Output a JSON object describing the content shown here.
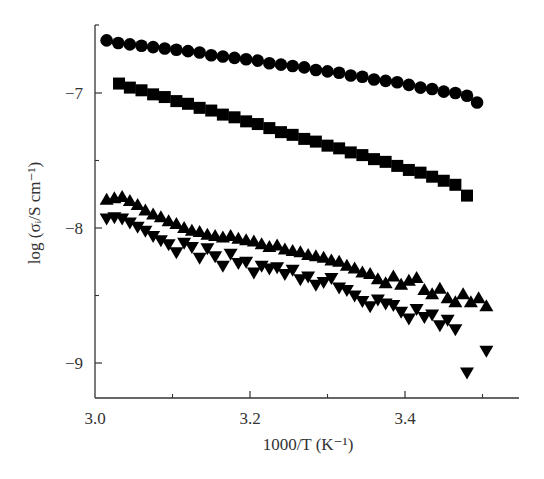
{
  "chart_data": {
    "type": "scatter",
    "title": "",
    "xlabel": "1000/T (K⁻¹)",
    "ylabel": "log (σᵢ/S cm⁻¹)",
    "xlim": [
      3.0,
      3.55
    ],
    "ylim": [
      -9.26,
      -6.34
    ],
    "x_ticks": [
      3.0,
      3.2,
      3.4
    ],
    "x_tick_labels": [
      "3.0",
      "3.2",
      "3.4"
    ],
    "x_minor_ticks": [
      3.1,
      3.3,
      3.5
    ],
    "y_ticks": [
      -7,
      -8,
      -9
    ],
    "y_tick_labels": [
      "−7",
      "−8",
      "−9"
    ],
    "y_minor_ticks": [
      -6.5,
      -7.5,
      -8.5
    ],
    "grid": false,
    "legend": "none",
    "series": [
      {
        "name": "circles",
        "marker": "circle",
        "x": [
          3.015,
          3.03,
          3.045,
          3.06,
          3.075,
          3.09,
          3.105,
          3.12,
          3.135,
          3.15,
          3.165,
          3.18,
          3.195,
          3.21,
          3.225,
          3.24,
          3.255,
          3.27,
          3.285,
          3.3,
          3.315,
          3.33,
          3.345,
          3.36,
          3.375,
          3.39,
          3.405,
          3.42,
          3.435,
          3.45,
          3.465,
          3.48,
          3.493
        ],
        "y": [
          -6.61,
          -6.63,
          -6.64,
          -6.65,
          -6.66,
          -6.67,
          -6.68,
          -6.69,
          -6.7,
          -6.72,
          -6.73,
          -6.74,
          -6.75,
          -6.76,
          -6.78,
          -6.79,
          -6.8,
          -6.81,
          -6.83,
          -6.84,
          -6.85,
          -6.87,
          -6.88,
          -6.9,
          -6.91,
          -6.92,
          -6.94,
          -6.96,
          -6.97,
          -6.99,
          -7.0,
          -7.02,
          -7.07
        ]
      },
      {
        "name": "squares",
        "marker": "square",
        "x": [
          3.031,
          3.045,
          3.06,
          3.075,
          3.09,
          3.105,
          3.12,
          3.135,
          3.15,
          3.165,
          3.18,
          3.195,
          3.21,
          3.225,
          3.24,
          3.255,
          3.27,
          3.285,
          3.3,
          3.315,
          3.33,
          3.345,
          3.36,
          3.375,
          3.39,
          3.405,
          3.42,
          3.435,
          3.45,
          3.465,
          3.48
        ],
        "y": [
          -6.93,
          -6.96,
          -6.98,
          -7.01,
          -7.03,
          -7.06,
          -7.08,
          -7.11,
          -7.13,
          -7.16,
          -7.18,
          -7.21,
          -7.23,
          -7.26,
          -7.29,
          -7.31,
          -7.34,
          -7.36,
          -7.39,
          -7.41,
          -7.44,
          -7.46,
          -7.49,
          -7.51,
          -7.54,
          -7.57,
          -7.59,
          -7.62,
          -7.65,
          -7.68,
          -7.76
        ]
      },
      {
        "name": "up-triangles",
        "marker": "triangle-up",
        "x": [
          3.015,
          3.025,
          3.035,
          3.045,
          3.055,
          3.065,
          3.075,
          3.085,
          3.095,
          3.105,
          3.115,
          3.125,
          3.135,
          3.145,
          3.155,
          3.165,
          3.175,
          3.185,
          3.195,
          3.205,
          3.215,
          3.225,
          3.235,
          3.245,
          3.255,
          3.265,
          3.275,
          3.285,
          3.295,
          3.305,
          3.315,
          3.325,
          3.335,
          3.345,
          3.355,
          3.365,
          3.375,
          3.385,
          3.395,
          3.405,
          3.415,
          3.425,
          3.435,
          3.445,
          3.455,
          3.465,
          3.475,
          3.485,
          3.495,
          3.505
        ],
        "y": [
          -7.79,
          -7.78,
          -7.77,
          -7.8,
          -7.83,
          -7.87,
          -7.9,
          -7.92,
          -7.95,
          -7.97,
          -8.0,
          -8.02,
          -8.03,
          -8.05,
          -8.06,
          -8.07,
          -8.06,
          -8.08,
          -8.09,
          -8.1,
          -8.12,
          -8.14,
          -8.13,
          -8.16,
          -8.17,
          -8.18,
          -8.2,
          -8.21,
          -8.22,
          -8.24,
          -8.25,
          -8.28,
          -8.3,
          -8.33,
          -8.34,
          -8.38,
          -8.41,
          -8.36,
          -8.42,
          -8.39,
          -8.37,
          -8.46,
          -8.49,
          -8.45,
          -8.52,
          -8.55,
          -8.49,
          -8.55,
          -8.52,
          -8.58
        ]
      },
      {
        "name": "down-triangles",
        "marker": "triangle-down",
        "x": [
          3.015,
          3.025,
          3.035,
          3.045,
          3.055,
          3.065,
          3.075,
          3.085,
          3.095,
          3.105,
          3.115,
          3.125,
          3.135,
          3.145,
          3.155,
          3.165,
          3.175,
          3.185,
          3.195,
          3.205,
          3.215,
          3.225,
          3.235,
          3.245,
          3.255,
          3.265,
          3.275,
          3.285,
          3.295,
          3.305,
          3.315,
          3.325,
          3.335,
          3.345,
          3.355,
          3.365,
          3.375,
          3.385,
          3.395,
          3.405,
          3.415,
          3.425,
          3.435,
          3.445,
          3.455,
          3.465,
          3.48,
          3.505
        ],
        "y": [
          -7.93,
          -7.92,
          -7.93,
          -7.96,
          -7.99,
          -8.02,
          -8.06,
          -8.09,
          -8.12,
          -8.18,
          -8.11,
          -8.14,
          -8.22,
          -8.15,
          -8.21,
          -8.28,
          -8.19,
          -8.26,
          -8.25,
          -8.33,
          -8.28,
          -8.3,
          -8.29,
          -8.34,
          -8.31,
          -8.38,
          -8.36,
          -8.42,
          -8.4,
          -8.37,
          -8.44,
          -8.46,
          -8.5,
          -8.54,
          -8.58,
          -8.53,
          -8.56,
          -8.57,
          -8.62,
          -8.67,
          -8.6,
          -8.66,
          -8.64,
          -8.72,
          -8.68,
          -8.75,
          -9.07,
          -8.91
        ]
      }
    ]
  },
  "layout": {
    "plot_px": {
      "left": 95,
      "right": 519,
      "top": 25,
      "bottom": 398
    },
    "marker_color": "#000000",
    "axis_color": "#333333"
  }
}
